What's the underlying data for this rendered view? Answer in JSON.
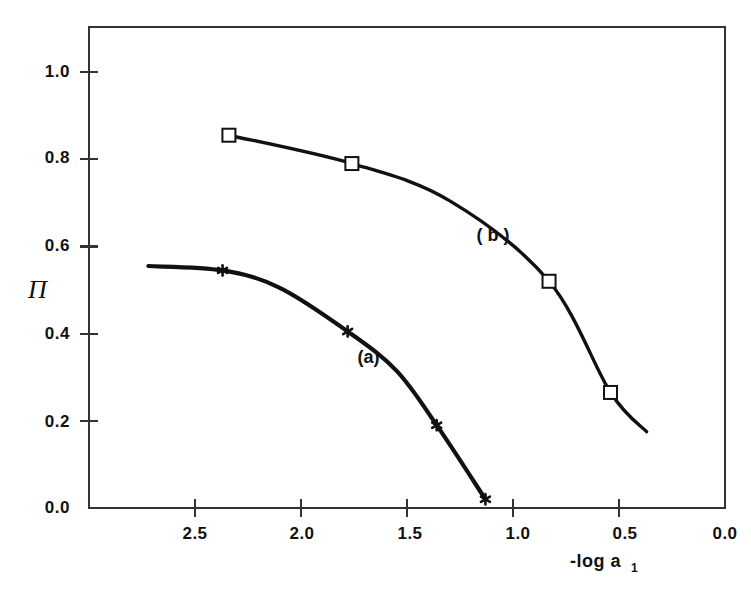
{
  "chart_data": {
    "type": "line",
    "title": "",
    "subtitle": "",
    "xlabel": "-log a",
    "xlabel_subscript": "1",
    "ylabel": "Π",
    "xlim": [
      2.9,
      0.0
    ],
    "ylim": [
      0.0,
      1.1
    ],
    "x_axis_inverted": true,
    "grid": false,
    "legend_position": "inline-annotations",
    "xticks": [
      "2.5",
      "2.0",
      "1.5",
      "1.0",
      "0.5",
      "0.0"
    ],
    "xtick_values": [
      2.5,
      2.0,
      1.5,
      1.0,
      0.5,
      0.0
    ],
    "yticks": [
      "0.0",
      "0.2",
      "0.4",
      "0.6",
      "0.8",
      "1.0"
    ],
    "ytick_values": [
      0.0,
      0.2,
      0.4,
      0.6,
      0.8,
      1.0
    ],
    "series": [
      {
        "name": "(a)",
        "marker": "star",
        "annotation": "(a)",
        "annotation_x": 1.63,
        "annotation_y": 0.345,
        "points": [
          {
            "x": 2.72,
            "y": 0.555
          },
          {
            "x": 2.37,
            "y": 0.545
          },
          {
            "x": 2.1,
            "y": 0.505
          },
          {
            "x": 1.78,
            "y": 0.405
          },
          {
            "x": 1.55,
            "y": 0.315
          },
          {
            "x": 1.36,
            "y": 0.19
          },
          {
            "x": 1.13,
            "y": 0.02
          }
        ],
        "marker_points": [
          {
            "x": 2.37,
            "y": 0.545
          },
          {
            "x": 1.78,
            "y": 0.405
          },
          {
            "x": 1.36,
            "y": 0.19
          },
          {
            "x": 1.13,
            "y": 0.02
          }
        ]
      },
      {
        "name": "(b)",
        "marker": "open-square",
        "annotation": "( b )",
        "annotation_x": 1.04,
        "annotation_y": 0.625,
        "points": [
          {
            "x": 2.34,
            "y": 0.855
          },
          {
            "x": 1.76,
            "y": 0.79
          },
          {
            "x": 1.3,
            "y": 0.705
          },
          {
            "x": 0.83,
            "y": 0.52
          },
          {
            "x": 0.54,
            "y": 0.265
          },
          {
            "x": 0.37,
            "y": 0.175
          }
        ],
        "marker_points": [
          {
            "x": 2.34,
            "y": 0.855
          },
          {
            "x": 1.76,
            "y": 0.79
          },
          {
            "x": 0.83,
            "y": 0.52
          },
          {
            "x": 0.54,
            "y": 0.265
          }
        ]
      }
    ],
    "colors": {
      "curve": "#111111",
      "axis": "#333333",
      "text": "#111111",
      "background": "#ffffff",
      "marker_fill": "#ffffff"
    }
  }
}
